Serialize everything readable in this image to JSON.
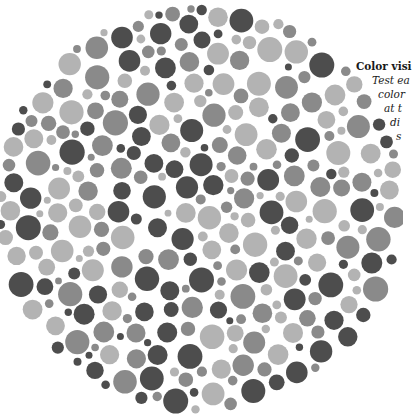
{
  "plate": {
    "center": [
      200,
      208
    ],
    "radius": 206,
    "colors": {
      "dark": "#4d4d4d",
      "mid": "#8a8a8a",
      "light": "#b3b3b3",
      "background": "#ffffff"
    },
    "seed": 7
  },
  "caption": {
    "title": "Color visi",
    "lines": [
      {
        "text": "Test ea",
        "left": 372,
        "top": 74
      },
      {
        "text": "color",
        "left": 378,
        "top": 88
      },
      {
        "text": "at t",
        "left": 384,
        "top": 102
      },
      {
        "text": "di",
        "left": 390,
        "top": 116
      },
      {
        "text": "s",
        "left": 396,
        "top": 130
      }
    ],
    "title_pos": {
      "left": 356,
      "top": 60
    }
  }
}
